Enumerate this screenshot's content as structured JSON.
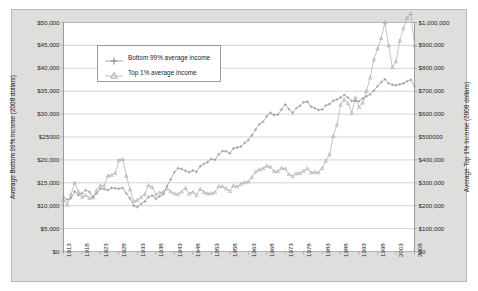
{
  "chart_data": {
    "type": "line",
    "title": "",
    "xlabel": "",
    "ylabel": "Average Bottom 99% Income (2008 dollars)",
    "y2label": "Average Top 1% Income (2008 dollars)",
    "grid": true,
    "legend_position": "upper-left-inside",
    "xlim": [
      1913,
      2008
    ],
    "xticks": [
      "1913",
      "1918",
      "1923",
      "1928",
      "1933",
      "1938",
      "1943",
      "1948",
      "1953",
      "1958",
      "1963",
      "1968",
      "1973",
      "1978",
      "1983",
      "1988",
      "1993",
      "1998",
      "2003",
      "2008"
    ],
    "ylim": [
      0,
      50000
    ],
    "yticks": [
      "$0",
      "$5,000",
      "$10,000",
      "$15,000",
      "$20,000",
      "$25000",
      "$30,000",
      "$35,000",
      "$40,000",
      "$45,000",
      "$50,000"
    ],
    "y2lim": [
      0,
      1000000
    ],
    "y2ticks": [
      "$0",
      "$100,000",
      "$200,000",
      "$300,000",
      "$400,000",
      "$500000",
      "$600,000",
      "$700,000",
      "$800,000",
      "$900,000",
      "$1,000,000"
    ],
    "x": [
      1913,
      1914,
      1915,
      1916,
      1917,
      1918,
      1919,
      1920,
      1921,
      1922,
      1923,
      1924,
      1925,
      1926,
      1927,
      1928,
      1929,
      1930,
      1931,
      1932,
      1933,
      1934,
      1935,
      1936,
      1937,
      1938,
      1939,
      1940,
      1941,
      1942,
      1943,
      1944,
      1945,
      1946,
      1947,
      1948,
      1949,
      1950,
      1951,
      1952,
      1953,
      1954,
      1955,
      1956,
      1957,
      1958,
      1959,
      1960,
      1961,
      1962,
      1963,
      1964,
      1965,
      1966,
      1967,
      1968,
      1969,
      1970,
      1971,
      1972,
      1973,
      1974,
      1975,
      1976,
      1977,
      1978,
      1979,
      1980,
      1981,
      1982,
      1983,
      1984,
      1985,
      1986,
      1987,
      1988,
      1989,
      1990,
      1991,
      1992,
      1993,
      1994,
      1995,
      1996,
      1997,
      1998,
      1999,
      2000,
      2001,
      2002,
      2003,
      2004,
      2005,
      2006,
      2007,
      2008
    ],
    "series": [
      {
        "name": "Bottom 99% average income",
        "axis": "left",
        "marker": "plus",
        "color": "#9b9b99",
        "values": [
          11900,
          11300,
          11600,
          13100,
          12300,
          12700,
          13400,
          13000,
          11900,
          12700,
          13700,
          13600,
          13400,
          13900,
          13800,
          13700,
          13900,
          12700,
          11600,
          10000,
          9700,
          10400,
          10900,
          11900,
          12200,
          11500,
          12000,
          12500,
          14300,
          15700,
          17300,
          18200,
          18000,
          17600,
          17300,
          17700,
          17400,
          18600,
          19100,
          19500,
          20200,
          20000,
          21200,
          21900,
          21900,
          21400,
          22500,
          22700,
          22900,
          23700,
          24300,
          25400,
          26600,
          27800,
          28300,
          29500,
          30300,
          29800,
          29900,
          31000,
          32100,
          31100,
          30300,
          31300,
          31800,
          32600,
          32700,
          31600,
          31300,
          30900,
          31000,
          31900,
          32200,
          32900,
          33200,
          33600,
          34200,
          33600,
          32900,
          32900,
          32800,
          33400,
          33900,
          34300,
          35100,
          36100,
          37000,
          37600,
          36700,
          36400,
          36300,
          36500,
          36700,
          37200,
          37500,
          36000
        ]
      },
      {
        "name": "Top 1% average income",
        "axis": "right",
        "marker": "triangle",
        "color": "#b0b0ae",
        "values": [
          225000,
          205000,
          247000,
          300000,
          262000,
          238000,
          246000,
          233000,
          236000,
          267000,
          288000,
          286000,
          331000,
          333000,
          342000,
          398000,
          404000,
          330000,
          271000,
          219000,
          224000,
          236000,
          250000,
          289000,
          281000,
          248000,
          257000,
          260000,
          274000,
          262000,
          253000,
          250000,
          261000,
          277000,
          252000,
          260000,
          246000,
          273000,
          259000,
          253000,
          254000,
          258000,
          284000,
          285000,
          275000,
          264000,
          288000,
          283000,
          294000,
          301000,
          305000,
          324000,
          348000,
          357000,
          362000,
          374000,
          370000,
          351000,
          350000,
          364000,
          362000,
          337000,
          328000,
          341000,
          342000,
          352000,
          363000,
          344000,
          347000,
          345000,
          364000,
          396000,
          424000,
          504000,
          553000,
          641000,
          663000,
          648000,
          604000,
          673000,
          630000,
          650000,
          700000,
          759000,
          838000,
          886000,
          932000,
          1000000,
          900000,
          805000,
          830000,
          920000,
          975000,
          1020000,
          1040000,
          900000
        ]
      }
    ],
    "legend": [
      {
        "label": "Bottom 99% average income",
        "marker": "plus"
      },
      {
        "label": "Top 1% average income",
        "marker": "triangle"
      }
    ]
  },
  "colors": {
    "panel_background": "#dededc",
    "plot_background": "#ffffff",
    "gridline": "#c2c2c0",
    "frame": "#9a9a98",
    "series_bottom99": "#9b9b99",
    "series_top1": "#b0b0ae",
    "text": "#1d1d1d"
  }
}
